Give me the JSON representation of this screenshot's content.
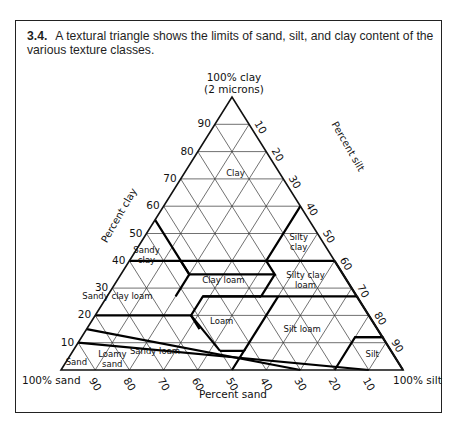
{
  "figure": {
    "number": "3.4.",
    "caption": "A textural triangle shows the limits of sand, silt, and clay content of the various texture classes."
  },
  "chart_data": {
    "type": "ternary",
    "apex_labels": {
      "top": [
        "100% clay",
        "(2 microns)"
      ],
      "bottom_left": "100% sand",
      "bottom_right": "100% silt"
    },
    "axis_titles": {
      "left": "Percent clay",
      "right": "Percent silt",
      "bottom": "Percent sand"
    },
    "ticks": {
      "clay": [
        10,
        20,
        30,
        40,
        50,
        60,
        70,
        80,
        90
      ],
      "silt": [
        10,
        20,
        30,
        40,
        50,
        60,
        70,
        80,
        90
      ],
      "sand": [
        90,
        80,
        70,
        60,
        50,
        40,
        30,
        20,
        10
      ]
    },
    "grid_step": 10,
    "classes": [
      {
        "name": "Clay",
        "label_lines": [
          "Clay"
        ],
        "label_pos": {
          "clay": 72,
          "silt": 15
        }
      },
      {
        "name": "Sandy clay",
        "label_lines": [
          "Sandy",
          "clay"
        ],
        "label_pos": {
          "clay": 42,
          "silt": 4
        }
      },
      {
        "name": "Silty clay",
        "label_lines": [
          "Silty",
          "clay"
        ],
        "label_pos": {
          "clay": 47,
          "silt": 46
        }
      },
      {
        "name": "Clay loam",
        "label_lines": [
          "Clay loam"
        ],
        "label_pos": {
          "clay": 33,
          "silt": 31
        }
      },
      {
        "name": "Silty clay loam",
        "label_lines": [
          "Silty clay",
          "loam"
        ],
        "label_pos": {
          "clay": 33,
          "silt": 55
        }
      },
      {
        "name": "Sandy clay loam",
        "label_lines": [
          "Sandy clay loam"
        ],
        "label_pos": {
          "clay": 27,
          "silt": 3
        }
      },
      {
        "name": "Loam",
        "label_lines": [
          "Loam"
        ],
        "label_pos": {
          "clay": 18,
          "silt": 38
        }
      },
      {
        "name": "Silt loam",
        "label_lines": [
          "Silt loam"
        ],
        "label_pos": {
          "clay": 15,
          "silt": 63
        }
      },
      {
        "name": "Sandy loam",
        "label_lines": [
          "Sandy loam"
        ],
        "label_pos": {
          "clay": 7,
          "silt": 24
        }
      },
      {
        "name": "Silt",
        "label_lines": [
          "Silt"
        ],
        "label_pos": {
          "clay": 6,
          "silt": 88
        }
      },
      {
        "name": "Loamy sand",
        "label_lines": [
          "Loamy",
          "sand"
        ],
        "label_pos": {
          "clay": 4,
          "silt": 13
        }
      },
      {
        "name": "Sand",
        "label_lines": [
          "Sand"
        ],
        "label_pos": {
          "clay": 3,
          "silt": 3
        }
      }
    ],
    "boundaries": [
      [
        [
          40,
          0
        ],
        [
          40,
          15
        ],
        [
          40,
          40
        ],
        [
          60,
          40
        ]
      ],
      [
        [
          55,
          0
        ],
        [
          35,
          20
        ],
        [
          35,
          45
        ],
        [
          40,
          40
        ]
      ],
      [
        [
          40,
          40
        ],
        [
          40,
          60
        ]
      ],
      [
        [
          35,
          20
        ],
        [
          40,
          15
        ]
      ],
      [
        [
          35,
          45
        ],
        [
          27,
          45
        ],
        [
          27,
          73
        ],
        [
          40,
          60
        ]
      ],
      [
        [
          27,
          20
        ],
        [
          35,
          20
        ]
      ],
      [
        [
          27,
          45
        ],
        [
          27,
          28
        ],
        [
          20,
          28
        ],
        [
          15,
          33
        ]
      ],
      [
        [
          20,
          0
        ],
        [
          20,
          28
        ]
      ],
      [
        [
          27,
          28
        ],
        [
          27,
          45
        ]
      ],
      [
        [
          7,
          43
        ],
        [
          7,
          50
        ],
        [
          0,
          50
        ]
      ],
      [
        [
          7,
          43
        ],
        [
          20,
          28
        ]
      ],
      [
        [
          27,
          73
        ],
        [
          12,
          88
        ],
        [
          12,
          80
        ],
        [
          0,
          80
        ]
      ],
      [
        [
          12,
          80
        ],
        [
          12,
          88
        ],
        [
          0,
          100
        ]
      ],
      [
        [
          7,
          50
        ],
        [
          27,
          50
        ]
      ],
      [
        [
          15,
          0
        ],
        [
          0,
          70
        ]
      ],
      [
        [
          10,
          0
        ],
        [
          0,
          90
        ]
      ]
    ]
  }
}
